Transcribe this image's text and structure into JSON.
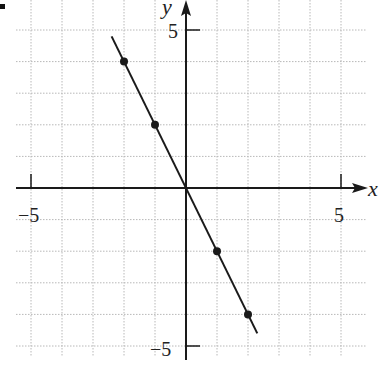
{
  "chart_data": {
    "type": "line",
    "title": "",
    "xlabel": "x",
    "ylabel": "y",
    "xlim": [
      -5.5,
      5.5
    ],
    "ylim": [
      -5.5,
      5.5
    ],
    "grid": true,
    "tick_labels": {
      "x": [
        {
          "value": -5,
          "label": "−5"
        },
        {
          "value": 5,
          "label": "5"
        }
      ],
      "y": [
        {
          "value": 5,
          "label": "5"
        },
        {
          "value": -5,
          "label": "−5"
        }
      ]
    },
    "series": [
      {
        "name": "y = -2x",
        "line": {
          "x": [
            -2.4,
            2.3
          ],
          "y": [
            4.8,
            -4.6
          ]
        },
        "points": {
          "x": [
            -2,
            -1,
            1,
            2
          ],
          "y": [
            4,
            2,
            -2,
            -4
          ]
        }
      }
    ]
  },
  "labels": {
    "x_axis": "x",
    "y_axis": "y",
    "x_neg5": "−5",
    "x_pos5": "5",
    "y_pos5": "5",
    "y_neg5": "−5"
  },
  "colors": {
    "axis": "#1a1a1a",
    "grid": "#b8b8b8",
    "line": "#1a1a1a"
  }
}
